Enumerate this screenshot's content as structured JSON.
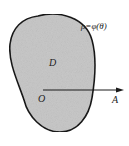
{
  "diagram": {
    "curve_label": "ρ=φ(θ)",
    "region_label": "D",
    "origin_label": "O",
    "axis_label": "A",
    "colors": {
      "region_fill": "#c8c8c8",
      "outline": "#1a1a1a",
      "text": "#222222"
    }
  }
}
